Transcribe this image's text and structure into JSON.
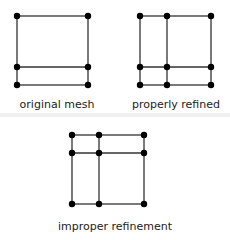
{
  "diagrams": [
    {
      "label": "original mesh"
    },
    {
      "label": "properly refined"
    },
    {
      "label": "improper refinement"
    }
  ],
  "colors": {
    "line": "#333333",
    "node": "#000000",
    "separator": "#eeeeee"
  }
}
